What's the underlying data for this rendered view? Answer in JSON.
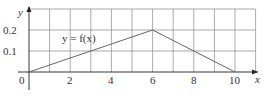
{
  "chart_data": {
    "type": "line",
    "title": "",
    "xlabel": "x",
    "ylabel": "y",
    "xlim": [
      0,
      11
    ],
    "ylim": [
      0,
      0.3
    ],
    "grid": true,
    "x_ticks": [
      0,
      1,
      2,
      3,
      4,
      5,
      6,
      7,
      8,
      9,
      10,
      11
    ],
    "x_tick_labels": [
      "0",
      "2",
      "4",
      "6",
      "8",
      "10"
    ],
    "x_tick_label_values": [
      0,
      2,
      4,
      6,
      8,
      10
    ],
    "y_tick_labels": [
      "0.1",
      "0.2"
    ],
    "y_tick_label_values": [
      0.1,
      0.2
    ],
    "series": [
      {
        "name": "y = f(x)",
        "x": [
          0,
          6,
          10
        ],
        "y": [
          0,
          0.2,
          0
        ]
      }
    ],
    "annotations": [
      {
        "text": "y = f(x)",
        "x": 2.3,
        "y": 0.17
      }
    ],
    "origin_label": "0",
    "colors": {
      "line": "#666666",
      "grid": "#888888",
      "axis": "#222222"
    }
  }
}
